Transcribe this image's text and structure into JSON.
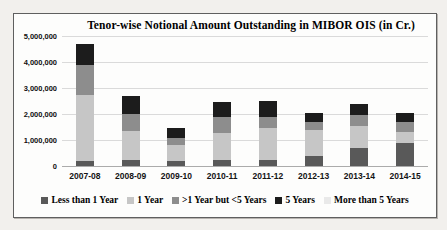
{
  "chart_data": {
    "type": "bar",
    "stacked": true,
    "title": "Tenor-wise Notional Amount Outstanding in MIBOR OIS (in Cr.)",
    "categories": [
      "2007-08",
      "2008-09",
      "2009-10",
      "2010-11",
      "2011-12",
      "2012-13",
      "2013-14",
      "2014-15"
    ],
    "series": [
      {
        "name": "Less than 1 Year",
        "color": "#595959",
        "values": [
          200000,
          240000,
          200000,
          250000,
          250000,
          400000,
          700000,
          900000
        ]
      },
      {
        "name": "1 Year",
        "color": "#c6c6c6",
        "values": [
          2550000,
          1110000,
          610000,
          1030000,
          1230000,
          1000000,
          850000,
          400000
        ]
      },
      {
        "name": ">1 Year but <5 Years",
        "color": "#8d8d8d",
        "values": [
          1150000,
          650000,
          280000,
          600000,
          400000,
          300000,
          400000,
          400000
        ]
      },
      {
        "name": "5 Years",
        "color": "#1c1c1c",
        "values": [
          800000,
          700000,
          360000,
          600000,
          640000,
          350000,
          450000,
          350000
        ]
      },
      {
        "name": "More than 5 Years",
        "color": "#e9e9e9",
        "values": [
          0,
          0,
          0,
          0,
          0,
          0,
          0,
          0
        ]
      }
    ],
    "ylim": [
      0,
      5000000
    ],
    "ytick_labels": [
      "5,000,000",
      "4,000,000",
      "3,000,000",
      "2,000,000",
      "1,000,000",
      "0"
    ],
    "grid": true,
    "legend_position": "bottom",
    "plot_background": "#fdfdfc"
  }
}
